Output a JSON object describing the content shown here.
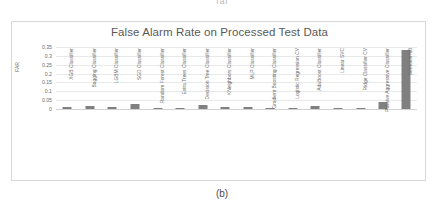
{
  "page": {
    "top_caption": "(a)",
    "bottom_caption": "(b)"
  },
  "chart_data": {
    "type": "bar",
    "title": "False Alarm Rate on Processed Test Data",
    "xlabel": "",
    "ylabel": "FAR",
    "ylim": [
      0,
      0.35
    ],
    "yticks": [
      "0",
      "0.05",
      "0.1",
      "0.15",
      "0.2",
      "0.25",
      "0.3",
      "0.35"
    ],
    "ytick_values": [
      0,
      0.05,
      0.1,
      0.15,
      0.2,
      0.25,
      0.3,
      0.35
    ],
    "grid": true,
    "legend": false,
    "bar_color": "#808080",
    "categories": [
      "XGB Classifier",
      "Bagging Classifier",
      "LGBM Classifier",
      "SGD Classifier",
      "Random Forest Classifier",
      "Extra Trees Classifier",
      "Decision Tree Classifier",
      "KNeighbors Classifier",
      "MLP Classifier",
      "Gradient Boosting Classifier",
      "Logistic Regression CV",
      "AdaBoost Classifier",
      "Linear SVC",
      "Ridge Classifier CV",
      "Passive Aggressive Classifier",
      "Bernoulli NB"
    ],
    "values": [
      0.012,
      0.018,
      0.009,
      0.031,
      0.007,
      0.008,
      0.022,
      0.014,
      0.011,
      0.005,
      0.008,
      0.017,
      0.005,
      0.0,
      0.038,
      0.331
    ]
  }
}
